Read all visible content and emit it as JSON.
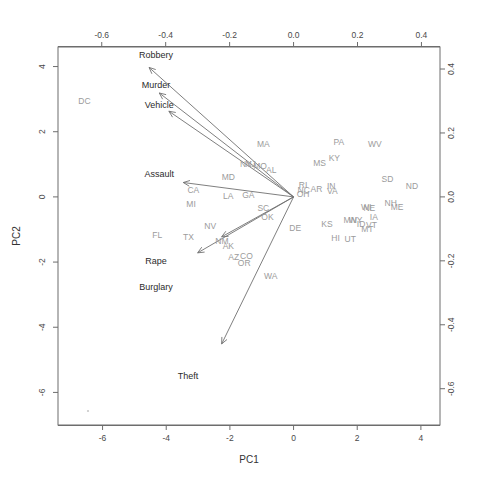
{
  "figure": {
    "type": "biplot",
    "bottom_axis_label": "PC1",
    "left_axis_label": "PC2"
  },
  "chart_data": {
    "type": "scatter",
    "title": "",
    "subtitle": "",
    "xlabel": "PC1",
    "ylabel": "PC2",
    "grid": false,
    "legend": "none",
    "score_axes": {
      "x_ticks": [
        -6,
        -4,
        -2,
        0,
        2,
        4
      ],
      "y_ticks": [
        -6,
        -4,
        -2,
        0,
        2,
        4
      ],
      "xlim": [
        -7.4,
        4.6
      ],
      "ylim": [
        -7.0,
        4.6
      ],
      "x_tick_labels": [
        "-6",
        "-4",
        "-2",
        "0",
        "2",
        "4"
      ],
      "y_tick_labels": [
        "-6",
        "-4",
        "-2",
        "0",
        "2",
        "4"
      ]
    },
    "loading_axes": {
      "x_ticks": [
        -0.8,
        -0.6,
        -0.4,
        -0.2,
        0.0,
        0.2,
        0.4
      ],
      "y_ticks": [
        -0.8,
        -0.6,
        -0.4,
        -0.2,
        0.0,
        0.2,
        0.4
      ],
      "x_tick_labels": [
        "-0.8",
        "-0.6",
        "-0.4",
        "-0.2",
        "0.0",
        "0.2",
        "0.4"
      ],
      "y_tick_labels": [
        "-0.8",
        "-0.6",
        "-0.4",
        "-0.2",
        "0.0",
        "0.2",
        "0.4"
      ]
    },
    "points": [
      {
        "label": "DC",
        "x": -6.57,
        "y": 2.95
      },
      {
        "label": "MA",
        "x": -0.95,
        "y": 1.62
      },
      {
        "label": "PA",
        "x": 1.42,
        "y": 1.7
      },
      {
        "label": "WV",
        "x": 2.55,
        "y": 1.62
      },
      {
        "label": "NY",
        "x": -1.5,
        "y": 1.0
      },
      {
        "label": "NJ",
        "x": -1.35,
        "y": 1.0
      },
      {
        "label": "MO",
        "x": -1.05,
        "y": 0.95
      },
      {
        "label": "AL",
        "x": -0.7,
        "y": 0.82
      },
      {
        "label": "MS",
        "x": 0.82,
        "y": 1.05
      },
      {
        "label": "KY",
        "x": 1.28,
        "y": 1.2
      },
      {
        "label": "MD",
        "x": -2.05,
        "y": 0.62
      },
      {
        "label": "CA",
        "x": -3.15,
        "y": 0.22
      },
      {
        "label": "MI",
        "x": -3.22,
        "y": -0.22
      },
      {
        "label": "LA",
        "x": -2.05,
        "y": 0.02
      },
      {
        "label": "GA",
        "x": -1.42,
        "y": 0.05
      },
      {
        "label": "SC",
        "x": -0.95,
        "y": -0.35
      },
      {
        "label": "OK",
        "x": -0.82,
        "y": -0.62
      },
      {
        "label": "RI",
        "x": 0.3,
        "y": 0.38
      },
      {
        "label": "NC",
        "x": 0.32,
        "y": 0.22
      },
      {
        "label": "OH",
        "x": 0.3,
        "y": 0.08
      },
      {
        "label": "AR",
        "x": 0.72,
        "y": 0.25
      },
      {
        "label": "IN",
        "x": 1.18,
        "y": 0.32
      },
      {
        "label": "VA",
        "x": 1.22,
        "y": 0.18
      },
      {
        "label": "SD",
        "x": 2.95,
        "y": 0.55
      },
      {
        "label": "ND",
        "x": 3.72,
        "y": 0.32
      },
      {
        "label": "NH",
        "x": 3.05,
        "y": -0.18
      },
      {
        "label": "ME",
        "x": 3.25,
        "y": -0.3
      },
      {
        "label": "WI",
        "x": 2.28,
        "y": -0.3
      },
      {
        "label": "NE",
        "x": 2.38,
        "y": -0.35
      },
      {
        "label": "IA",
        "x": 2.52,
        "y": -0.62
      },
      {
        "label": "MN",
        "x": 1.78,
        "y": -0.72
      },
      {
        "label": "WY",
        "x": 1.95,
        "y": -0.72
      },
      {
        "label": "ID",
        "x": 2.12,
        "y": -0.82
      },
      {
        "label": "VT",
        "x": 2.45,
        "y": -0.85
      },
      {
        "label": "MT",
        "x": 2.32,
        "y": -0.98
      },
      {
        "label": "KS",
        "x": 1.05,
        "y": -0.82
      },
      {
        "label": "DE",
        "x": 0.05,
        "y": -0.95
      },
      {
        "label": "HI",
        "x": 1.32,
        "y": -1.25
      },
      {
        "label": "UT",
        "x": 1.78,
        "y": -1.28
      },
      {
        "label": "NV",
        "x": -2.62,
        "y": -0.88
      },
      {
        "label": "TX",
        "x": -3.3,
        "y": -1.22
      },
      {
        "label": "FL",
        "x": -4.28,
        "y": -1.18
      },
      {
        "label": "NM",
        "x": -2.25,
        "y": -1.35
      },
      {
        "label": "AK",
        "x": -2.05,
        "y": -1.52
      },
      {
        "label": "AZ",
        "x": -1.88,
        "y": -1.85
      },
      {
        "label": "CO",
        "x": -1.48,
        "y": -1.82
      },
      {
        "label": "OR",
        "x": -1.55,
        "y": -2.02
      },
      {
        "label": "WA",
        "x": -0.72,
        "y": -2.42
      }
    ],
    "loadings": [
      {
        "label": "Robbery",
        "x": -0.452,
        "y": 0.405,
        "tip_x": -0.452,
        "tip_y": 0.405,
        "label_x": -0.43,
        "label_y": 0.445
      },
      {
        "label": "Murder",
        "x": -0.42,
        "y": 0.325,
        "tip_x": -0.42,
        "tip_y": 0.325,
        "label_x": -0.43,
        "label_y": 0.35
      },
      {
        "label": "Vehicle",
        "x": -0.39,
        "y": 0.268,
        "tip_x": -0.39,
        "tip_y": 0.268,
        "label_x": -0.42,
        "label_y": 0.288
      },
      {
        "label": "Assault",
        "x": -0.345,
        "y": 0.045,
        "tip_x": -0.345,
        "tip_y": 0.045,
        "label_x": -0.42,
        "label_y": 0.072
      },
      {
        "label": "Rape",
        "x": -0.3,
        "y": -0.175,
        "tip_x": -0.3,
        "tip_y": -0.175,
        "label_x": -0.43,
        "label_y": -0.2
      },
      {
        "label": "Burglary",
        "x": -0.225,
        "y": -0.125,
        "tip_x": -0.225,
        "tip_y": -0.125,
        "label_x": -0.43,
        "label_y": -0.282
      },
      {
        "label": "Theft",
        "x": -0.225,
        "y": -0.46,
        "tip_x": -0.225,
        "tip_y": -0.46,
        "label_x": -0.33,
        "label_y": -0.56
      }
    ]
  }
}
